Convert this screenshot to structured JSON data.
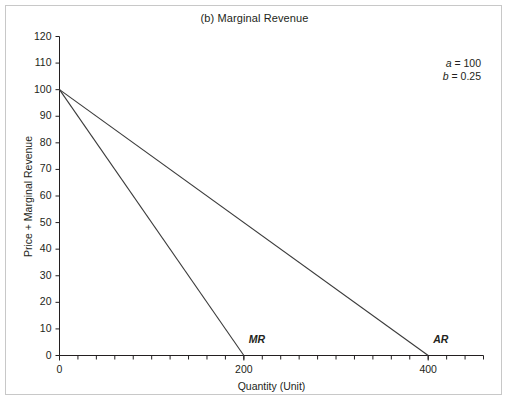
{
  "figure": {
    "border_color": "#c8c8c8",
    "background": "#ffffff"
  },
  "chart_data": {
    "type": "line",
    "title": "(b) Marginal Revenue",
    "xlabel": "Quantity (Unit)",
    "ylabel": "Price + Marginal Revenue",
    "xlim": [
      0,
      460
    ],
    "ylim": [
      0,
      120
    ],
    "grid": false,
    "legend_position": "inline-end-of-line",
    "axis_color": "#231f20",
    "line_color": "#3a3a3a",
    "x_ticks_labeled": [
      {
        "value": 0,
        "label": "0"
      },
      {
        "value": 200,
        "label": "200"
      },
      {
        "value": 400,
        "label": "400"
      }
    ],
    "x_minor_tick_step": 20,
    "y_ticks": [
      {
        "value": 0,
        "label": "0"
      },
      {
        "value": 10,
        "label": "10"
      },
      {
        "value": 20,
        "label": "20"
      },
      {
        "value": 30,
        "label": "30"
      },
      {
        "value": 40,
        "label": "40"
      },
      {
        "value": 50,
        "label": "50"
      },
      {
        "value": 60,
        "label": "60"
      },
      {
        "value": 70,
        "label": "70"
      },
      {
        "value": 80,
        "label": "80"
      },
      {
        "value": 90,
        "label": "90"
      },
      {
        "value": 100,
        "label": "100"
      },
      {
        "value": 110,
        "label": "110"
      },
      {
        "value": 120,
        "label": "120"
      }
    ],
    "series": [
      {
        "name": "AR",
        "label": "AR",
        "points": [
          [
            0,
            100
          ],
          [
            400,
            0
          ]
        ],
        "label_at": [
          400,
          0
        ]
      },
      {
        "name": "MR",
        "label": "MR",
        "points": [
          [
            0,
            100
          ],
          [
            200,
            0
          ]
        ],
        "label_at": [
          200,
          0
        ]
      }
    ],
    "annotations": [
      {
        "variable": "a",
        "equals": "= 100"
      },
      {
        "variable": "b",
        "equals": "= 0.25"
      }
    ]
  }
}
